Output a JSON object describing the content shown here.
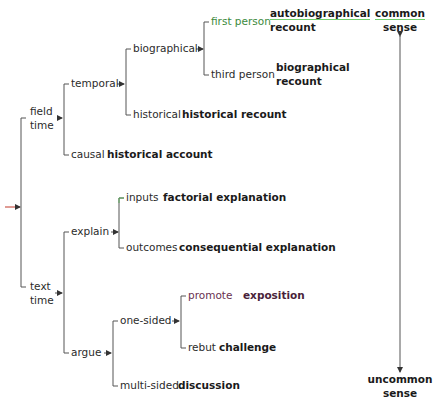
{
  "diagram": {
    "type": "genre-classification-tree",
    "root": {
      "branches": [
        {
          "label_lines": [
            "field",
            "time"
          ],
          "children": [
            {
              "label": "temporal",
              "children": [
                {
                  "label": "biographical",
                  "children": [
                    {
                      "label": "first person",
                      "genre_lines": [
                        "autobiographical",
                        "recount"
                      ],
                      "label_color": "#3c8a3c"
                    },
                    {
                      "label": "third person",
                      "genre_lines": [
                        "biographical",
                        "recount"
                      ]
                    }
                  ]
                },
                {
                  "label": "historical",
                  "genre": "historical recount"
                }
              ]
            },
            {
              "label": "causal",
              "genre": "historical account"
            }
          ]
        },
        {
          "label_lines": [
            "text",
            "time"
          ],
          "children": [
            {
              "label": "explain",
              "children": [
                {
                  "label": "inputs",
                  "genre": "factorial explanation"
                },
                {
                  "label": "outcomes",
                  "genre": "consequential explanation"
                }
              ]
            },
            {
              "label": "argue",
              "children": [
                {
                  "label": "one-sided",
                  "children": [
                    {
                      "label": "promote",
                      "genre": "exposition",
                      "label_color": "#6a3050"
                    },
                    {
                      "label": "rebut",
                      "genre": "challenge"
                    }
                  ]
                },
                {
                  "label": "multi-sided",
                  "genre": "discussion"
                }
              ]
            }
          ]
        }
      ]
    },
    "scale": {
      "top_lines": [
        "common",
        "sense"
      ],
      "bottom_lines": [
        "uncommon",
        "sense"
      ]
    },
    "colors": {
      "line": "#555555",
      "root_arrow": "#c0392b",
      "highlight_green": "#3c8a3c",
      "highlight_maroon": "#6a3050"
    }
  }
}
